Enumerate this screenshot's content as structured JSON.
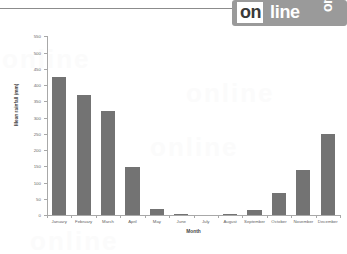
{
  "watermark": {
    "badge_text_primary": "on",
    "badge_text_secondary": "line",
    "badge_text_rotated": "onl",
    "background_ghost_text": "online"
  },
  "chart_data": {
    "type": "bar",
    "title": "",
    "subtitle": "",
    "xlabel": "Month",
    "ylabel": "Mean rainfall (mm)",
    "categories": [
      "January",
      "February",
      "March",
      "April",
      "May",
      "June",
      "July",
      "August",
      "September",
      "October",
      "November",
      "December"
    ],
    "values": [
      425,
      370,
      320,
      148,
      18,
      2,
      0,
      3,
      15,
      68,
      138,
      248
    ],
    "ylim": [
      0,
      550
    ],
    "ytick_labels": [
      "0",
      "50",
      "100",
      "150",
      "200",
      "250",
      "300",
      "350",
      "400",
      "450",
      "500",
      "550"
    ],
    "ytick_values": [
      0,
      50,
      100,
      150,
      200,
      250,
      300,
      350,
      400,
      450,
      500,
      550
    ],
    "grid": false,
    "legend": null,
    "bar_color": "#737373",
    "axis_color": "#a8a8a8",
    "text_color": "#5f5f5f"
  }
}
